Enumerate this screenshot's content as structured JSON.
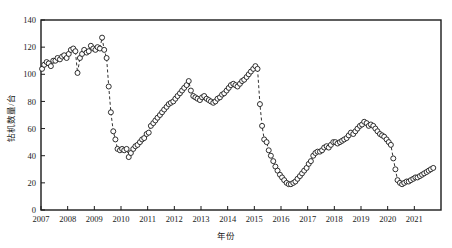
{
  "chart_data": {
    "type": "scatter",
    "title": "",
    "xlabel": "年份",
    "ylabel": "钻机数量/台",
    "xlim": [
      2007.0,
      2022.0
    ],
    "ylim": [
      0,
      140
    ],
    "ytick_values": [
      0,
      20,
      40,
      60,
      80,
      100,
      120,
      140
    ],
    "ytick_labels": [
      "0",
      "20",
      "40",
      "60",
      "80",
      "100",
      "120",
      "140"
    ],
    "xtick_values": [
      2007,
      2008,
      2009,
      2010,
      2011,
      2012,
      2013,
      2014,
      2015,
      2016,
      2017,
      2018,
      2019,
      2020,
      2021
    ],
    "xtick_labels": [
      "2007",
      "2008",
      "2009",
      "2010",
      "2011",
      "2012",
      "2013",
      "2014",
      "2015",
      "2016",
      "2017",
      "2018",
      "2019",
      "2020",
      "2021"
    ],
    "grid": false,
    "legend": null,
    "marker": "open-circle",
    "line_style": "dashed",
    "series": [
      {
        "name": "钻机数量",
        "x": [
          2007.04,
          2007.12,
          2007.21,
          2007.29,
          2007.37,
          2007.46,
          2007.54,
          2007.62,
          2007.71,
          2007.79,
          2007.87,
          2007.96,
          2008.04,
          2008.12,
          2008.21,
          2008.29,
          2008.37,
          2008.46,
          2008.54,
          2008.62,
          2008.71,
          2008.79,
          2008.87,
          2008.96,
          2009.04,
          2009.12,
          2009.21,
          2009.29,
          2009.37,
          2009.46,
          2009.54,
          2009.62,
          2009.71,
          2009.79,
          2009.87,
          2009.96,
          2010.04,
          2010.12,
          2010.21,
          2010.29,
          2010.37,
          2010.46,
          2010.54,
          2010.62,
          2010.71,
          2010.79,
          2010.87,
          2010.96,
          2011.04,
          2011.12,
          2011.21,
          2011.29,
          2011.37,
          2011.46,
          2011.54,
          2011.62,
          2011.71,
          2011.79,
          2011.87,
          2011.96,
          2012.04,
          2012.12,
          2012.21,
          2012.29,
          2012.37,
          2012.46,
          2012.54,
          2012.62,
          2012.71,
          2012.79,
          2012.87,
          2012.96,
          2013.04,
          2013.12,
          2013.21,
          2013.29,
          2013.37,
          2013.46,
          2013.54,
          2013.62,
          2013.71,
          2013.79,
          2013.87,
          2013.96,
          2014.04,
          2014.12,
          2014.21,
          2014.29,
          2014.37,
          2014.46,
          2014.54,
          2014.62,
          2014.71,
          2014.79,
          2014.87,
          2014.96,
          2015.04,
          2015.12,
          2015.21,
          2015.29,
          2015.37,
          2015.46,
          2015.54,
          2015.62,
          2015.71,
          2015.79,
          2015.87,
          2015.96,
          2016.04,
          2016.12,
          2016.21,
          2016.29,
          2016.37,
          2016.46,
          2016.54,
          2016.62,
          2016.71,
          2016.79,
          2016.87,
          2016.96,
          2017.04,
          2017.12,
          2017.21,
          2017.29,
          2017.37,
          2017.46,
          2017.54,
          2017.62,
          2017.71,
          2017.79,
          2017.87,
          2017.96,
          2018.04,
          2018.12,
          2018.21,
          2018.29,
          2018.37,
          2018.46,
          2018.54,
          2018.62,
          2018.71,
          2018.79,
          2018.87,
          2018.96,
          2019.04,
          2019.12,
          2019.21,
          2019.29,
          2019.37,
          2019.46,
          2019.54,
          2019.62,
          2019.71,
          2019.79,
          2019.87,
          2019.96,
          2020.04,
          2020.12,
          2020.21,
          2020.29,
          2020.37,
          2020.46,
          2020.54,
          2020.62,
          2020.71,
          2020.79,
          2020.87,
          2020.96,
          2021.04,
          2021.12,
          2021.21,
          2021.29,
          2021.37,
          2021.46,
          2021.54,
          2021.62,
          2021.71
        ],
        "values": [
          104,
          107,
          109,
          108,
          106,
          110,
          110,
          112,
          111,
          113,
          114,
          112,
          115,
          118,
          119,
          117,
          101,
          112,
          115,
          118,
          116,
          117,
          121,
          119,
          118,
          120,
          119,
          127,
          118,
          112,
          91,
          72,
          58,
          52,
          45,
          44,
          45,
          44,
          45,
          39,
          42,
          45,
          47,
          48,
          50,
          52,
          53,
          56,
          57,
          62,
          64,
          66,
          68,
          70,
          72,
          74,
          76,
          78,
          79,
          80,
          82,
          84,
          86,
          88,
          90,
          92,
          95,
          88,
          84,
          83,
          82,
          81,
          83,
          84,
          82,
          81,
          80,
          79,
          80,
          82,
          83,
          85,
          86,
          88,
          90,
          92,
          93,
          92,
          91,
          93,
          95,
          96,
          98,
          100,
          102,
          104,
          106,
          104,
          78,
          62,
          52,
          50,
          44,
          40,
          36,
          32,
          29,
          26,
          24,
          22,
          20,
          19,
          19,
          20,
          21,
          23,
          25,
          27,
          29,
          31,
          34,
          36,
          40,
          42,
          43,
          43,
          44,
          46,
          47,
          46,
          48,
          50,
          50,
          49,
          50,
          51,
          52,
          53,
          55,
          57,
          56,
          58,
          60,
          62,
          63,
          65,
          64,
          62,
          63,
          62,
          60,
          58,
          56,
          55,
          54,
          52,
          50,
          48,
          38,
          30,
          22,
          20,
          19,
          20,
          21,
          21,
          22,
          23,
          24,
          24,
          25,
          26,
          27,
          28,
          29,
          30,
          31
        ]
      }
    ]
  },
  "axes": {
    "ylabel": "钻机数量/台",
    "xlabel": "年份"
  }
}
